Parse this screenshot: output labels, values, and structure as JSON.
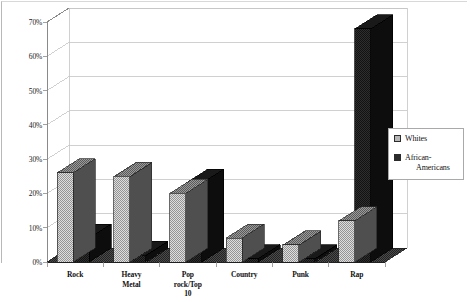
{
  "chart_data": {
    "type": "bar",
    "title": "",
    "subtitle": "",
    "xlabel": "",
    "ylabel": "",
    "ylim": [
      0,
      70
    ],
    "ytick_step": 10,
    "grid": true,
    "three_d": true,
    "legend_position": "right",
    "value_suffix": "%",
    "categories": [
      "Rock",
      "Heavy\nMetal",
      "Pop\nrock/Top\n10",
      "Country",
      "Punk",
      "Rap"
    ],
    "ytick_labels": [
      "0%",
      "10%",
      "20%",
      "30%",
      "40%",
      "50%",
      "60%",
      "70%"
    ],
    "ytick_values": [
      0,
      10,
      20,
      30,
      40,
      50,
      60,
      70
    ],
    "series": [
      {
        "name": "Whites",
        "color": "#c9c9c9",
        "values": [
          26,
          25,
          20,
          7,
          5,
          12
        ]
      },
      {
        "name": "African-Americans",
        "color": "#2b2b2b",
        "values": [
          7,
          2,
          23,
          1,
          1,
          68
        ]
      }
    ],
    "legend": [
      {
        "label": "Whites",
        "swatch": "light"
      },
      {
        "label": "African-",
        "label_cont": "Americans",
        "swatch": "dark"
      }
    ]
  },
  "colors": {
    "bar_light_face": "#c9c9c9",
    "bar_light_top": "#8a8a8a",
    "bar_light_side": "#5e5e5e",
    "bar_dark_face": "#2b2b2b",
    "bar_dark_top": "#1c1c1c",
    "bar_dark_side": "#141414",
    "gridline": "#c4c4c4",
    "axis": "#8a8a8a",
    "frame": "#b8b8b8",
    "floor": "#3a3a3a",
    "text": "#111111"
  }
}
